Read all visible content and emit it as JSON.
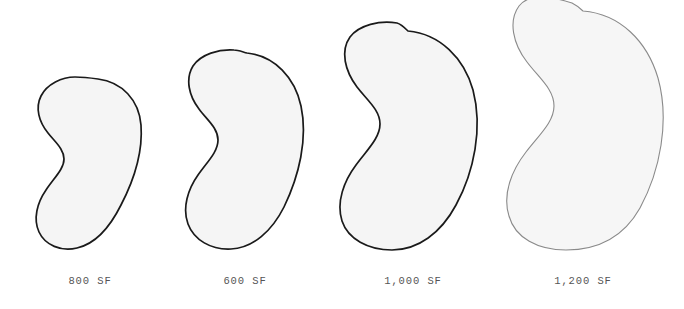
{
  "figure": {
    "type": "shape-comparison-diagram",
    "background_color": "#ffffff",
    "baseline_y": 249,
    "shape_fill_color": "#f5f5f5",
    "label_color": "#555555"
  },
  "shapes": [
    {
      "id": "shape-1",
      "label": "800 SF",
      "area_sf": 800,
      "label_center_x": 90,
      "stroke_color": "#1a1a1a",
      "stroke_width": 1.7,
      "fill_color": "#f5f5f5",
      "bbox": {
        "x": 35,
        "y": 78,
        "width": 107,
        "height": 171
      },
      "path": "M 98 79 C 122 82 139 100 141 125 C 143 152 134 180 121 205 C 110 227 95 244 77 248 C 61 252 45 245 39 232 C 33 219 37 203 46 190 C 54 178 64 169 64 159 C 64 149 55 142 48 133 C 39 122 35 108 41 96 C 47 84 62 77 75 77 C 83 77 91 78 98 79 Z"
    },
    {
      "id": "shape-2",
      "label": "600 SF",
      "area_sf": 600,
      "label_center_x": 245,
      "stroke_color": "#1a1a1a",
      "stroke_width": 1.7,
      "fill_color": "#f5f5f5",
      "bbox": {
        "x": 185,
        "y": 52,
        "width": 118,
        "height": 197
      },
      "path": "M 247 53 C 275 56 295 78 301 106 C 308 139 299 176 284 207 C 272 231 253 248 231 249 C 211 250 194 240 188 224 C 182 208 188 189 198 175 C 207 162 218 152 218 140 C 218 128 207 120 199 109 C 189 96 185 79 193 66 C 201 54 219 49 234 50 C 238 50 243 52 247 53 Z"
    },
    {
      "id": "shape-3",
      "label": "1,000 SF",
      "area_sf": 1000,
      "label_center_x": 413,
      "stroke_color": "#1a1a1a",
      "stroke_width": 1.7,
      "fill_color": "#f5f5f5",
      "bbox": {
        "x": 340,
        "y": 30,
        "width": 138,
        "height": 220
      },
      "path": "M 408 31 C 440 34 464 58 473 90 C 483 128 474 172 456 205 C 441 233 418 250 392 250 C 368 250 348 239 342 221 C 336 202 344 181 356 165 C 367 150 380 138 380 124 C 380 110 367 100 357 87 C 345 71 340 51 350 37 C 359 25 380 20 397 23 C 401 24 405 28 408 31 Z"
    },
    {
      "id": "shape-4",
      "label": "1,200 SF",
      "area_sf": 1200,
      "label_center_x": 583,
      "stroke_color": "#8a8a8a",
      "stroke_width": 1.1,
      "fill_color": "#f6f6f6",
      "bbox": {
        "x": 508,
        "y": 10,
        "width": 157,
        "height": 240
      },
      "path": "M 583 11 C 620 14 647 41 658 78 C 670 121 660 171 640 208 C 622 240 595 250 566 250 C 538 250 515 238 509 216 C 502 194 512 170 526 152 C 539 135 554 122 554 106 C 554 89 539 78 527 62 C 513 44 508 21 519 6 C 530 -8 553 -3 572 3 C 576 5 580 8 583 11 Z"
    }
  ]
}
